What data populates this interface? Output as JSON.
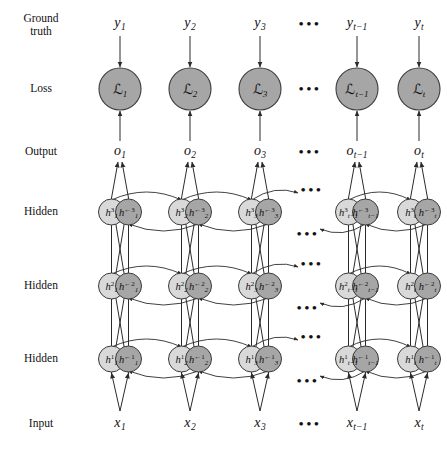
{
  "figure": {
    "background": "#ffffff",
    "node_fill_forward": "#d9d9d9",
    "node_fill_backward": "#a6a6a6",
    "node_stroke": "#3b3b3b",
    "edge_color": "#2b2b2b",
    "text_color": "#111111"
  },
  "row_labels": [
    {
      "id": "ground-truth",
      "text": "Ground\ntruth",
      "y": 24
    },
    {
      "id": "loss",
      "text": "Loss",
      "y": 89
    },
    {
      "id": "output",
      "text": "Output",
      "y": 152
    },
    {
      "id": "hidden-3",
      "text": "Hidden",
      "y": 212
    },
    {
      "id": "hidden-2",
      "text": "Hidden",
      "y": 286
    },
    {
      "id": "hidden-1",
      "text": "Hidden",
      "y": 359
    },
    {
      "id": "input",
      "text": "Input",
      "y": 424
    }
  ],
  "timesteps": [
    {
      "key": "1",
      "sub": "1",
      "x": 120,
      "group": "left"
    },
    {
      "key": "2",
      "sub": "2",
      "x": 190,
      "group": "left"
    },
    {
      "key": "3",
      "sub": "3",
      "x": 260,
      "group": "left"
    },
    {
      "key": "t-1",
      "sub": "t−1",
      "x": 357,
      "group": "right"
    },
    {
      "key": "t",
      "sub": "t",
      "x": 419,
      "group": "right"
    }
  ],
  "ellipsis_columns": [
    {
      "x": 310
    }
  ],
  "ground_truth": {
    "symbol": "y",
    "y": 24,
    "items": [
      {
        "sub": "1"
      },
      {
        "sub": "2"
      },
      {
        "sub": "3"
      },
      {
        "sub": "t−1"
      },
      {
        "sub": "t"
      }
    ]
  },
  "loss": {
    "symbol": "ℒ",
    "y": 89,
    "radius": 21,
    "items": [
      {
        "sub": "1"
      },
      {
        "sub": "2"
      },
      {
        "sub": "3"
      },
      {
        "sub": "t−1"
      },
      {
        "sub": "t"
      }
    ]
  },
  "output": {
    "symbol": "o",
    "y": 152,
    "items": [
      {
        "sub": "1"
      },
      {
        "sub": "2"
      },
      {
        "sub": "3"
      },
      {
        "sub": "t−1"
      },
      {
        "sub": "t"
      }
    ]
  },
  "input": {
    "symbol": "x",
    "y": 424,
    "items": [
      {
        "sub": "1"
      },
      {
        "sub": "2"
      },
      {
        "sub": "3"
      },
      {
        "sub": "t−1"
      },
      {
        "sub": "t"
      }
    ]
  },
  "hidden_layers": [
    {
      "level": "3",
      "y": 212,
      "label": "Hidden"
    },
    {
      "level": "2",
      "y": 286,
      "label": "Hidden"
    },
    {
      "level": "1",
      "y": 359,
      "label": "Hidden"
    }
  ],
  "hidden_node": {
    "symbol": "h",
    "radius": 13,
    "pair_offset": 17,
    "forward_superscript": "3",
    "backward_marker": "←",
    "legend": {
      "forward": "forward state (light)",
      "backward": "backward state (dark)"
    }
  },
  "edges": {
    "input_to_hidden": "each input feeds both forward and backward units of hidden layer 1",
    "hidden_to_hidden_vertical": "stacked layers 1 to 2 to 3",
    "recurrent_forward": "left to right arcs between consecutive timesteps",
    "recurrent_backward": "right to left arcs between consecutive timesteps",
    "hidden_to_output": "top hidden layer pair feeds the output",
    "output_to_loss": "output feeds loss",
    "truth_to_loss": "ground truth feeds loss"
  }
}
